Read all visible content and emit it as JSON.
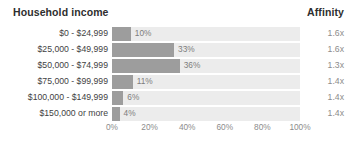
{
  "header": {
    "title": "Household income",
    "affinity_label": "Affinity"
  },
  "chart_data": {
    "type": "bar",
    "orientation": "horizontal",
    "title": "Household income",
    "xlabel": "",
    "ylabel": "",
    "xlim": [
      0,
      100
    ],
    "grid": false,
    "legend": false,
    "categories": [
      "$0 - $24,999",
      "$25,000 - $49,999",
      "$50,000 - $74,999",
      "$75,000 - $99,999",
      "$100,000 - $149,999",
      "$150,000 or more"
    ],
    "values": [
      10,
      33,
      36,
      11,
      6,
      4
    ],
    "value_labels": [
      "10%",
      "33%",
      "36%",
      "11%",
      "6%",
      "4%"
    ],
    "tick_labels": [
      "0%",
      "20%",
      "40%",
      "60%",
      "80%",
      "100%"
    ],
    "tick_values": [
      0,
      20,
      40,
      60,
      80,
      100
    ],
    "extra_column": {
      "header": "Affinity",
      "values": [
        "1.6x",
        "1.6x",
        "1.3x",
        "1.4x",
        "1.4x",
        "1.4x"
      ]
    },
    "colors": {
      "bar": "#9d9d9d",
      "track": "#ececec",
      "text": "#3f3f3f",
      "muted_text": "#8c8c8c",
      "background": "#ffffff"
    }
  }
}
